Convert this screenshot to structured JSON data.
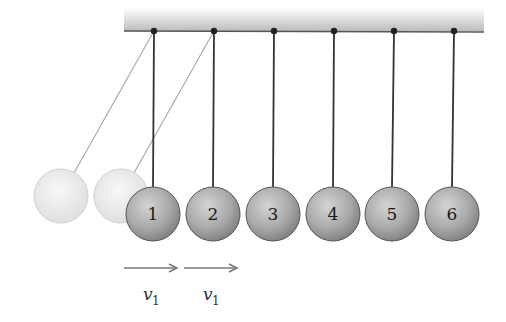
{
  "diagram": {
    "support_bar": {
      "x1": 124,
      "x2": 484,
      "top": 8,
      "bottom": 32,
      "color_top": "#ffffff",
      "color_bottom": "#bdbdbd",
      "edge_color": "#555555"
    },
    "balls": [
      {
        "label": "1",
        "cx": 153,
        "pivot_x": 154
      },
      {
        "label": "2",
        "cx": 213,
        "pivot_x": 214
      },
      {
        "label": "3",
        "cx": 273,
        "pivot_x": 274
      },
      {
        "label": "4",
        "cx": 333,
        "pivot_x": 334
      },
      {
        "label": "5",
        "cx": 392,
        "pivot_x": 394
      },
      {
        "label": "6",
        "cx": 452,
        "pivot_x": 454
      }
    ],
    "ball_cy": 214,
    "ball_radius": 27,
    "ball_color": "#9a9a9a",
    "ghost_balls": [
      {
        "cx": 61,
        "cy": 196,
        "pivot_x": 154
      },
      {
        "cx": 121,
        "cy": 196,
        "pivot_x": 214
      }
    ],
    "velocity_labels": [
      {
        "text": "v",
        "sub": "1",
        "arrow_x1": 124,
        "arrow_x2": 178
      },
      {
        "text": "v",
        "sub": "1",
        "arrow_x1": 184,
        "arrow_x2": 238
      }
    ]
  }
}
